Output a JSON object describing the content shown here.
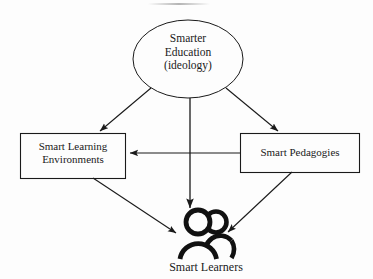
{
  "diagram": {
    "background_color": "#fdfdfd",
    "stroke_color": "#1a1a1a",
    "nodes": {
      "ideology": {
        "shape": "ellipse",
        "label": "Smarter\nEducation\n(ideology)",
        "lines": [
          "Smarter",
          "Education",
          "(ideology)"
        ]
      },
      "environments": {
        "shape": "rectangle",
        "label": "Smart Learning\nEnvironments",
        "lines": [
          "Smart Learning",
          "Environments"
        ]
      },
      "pedagogies": {
        "shape": "rectangle",
        "label": "Smart Pedagogies",
        "lines": [
          "Smart Pedagogies"
        ]
      },
      "learners": {
        "shape": "people-icon",
        "label": "Smart Learners",
        "icon": "two-people-icon"
      }
    },
    "edges": [
      {
        "name": "ideology-to-environments",
        "from": "ideology",
        "to": "environments",
        "style": "solid",
        "arrow": "end"
      },
      {
        "name": "ideology-to-pedagogies",
        "from": "ideology",
        "to": "pedagogies",
        "style": "solid",
        "arrow": "end"
      },
      {
        "name": "ideology-to-learners",
        "from": "ideology",
        "to": "learners",
        "style": "solid",
        "arrow": "end"
      },
      {
        "name": "pedagogies-to-environments",
        "from": "pedagogies",
        "to": "environments",
        "style": "solid",
        "arrow": "end"
      },
      {
        "name": "environments-to-learners",
        "from": "environments",
        "to": "learners",
        "style": "solid",
        "arrow": "end"
      },
      {
        "name": "pedagogies-to-learners",
        "from": "pedagogies",
        "to": "learners",
        "style": "solid",
        "arrow": "end"
      }
    ]
  }
}
